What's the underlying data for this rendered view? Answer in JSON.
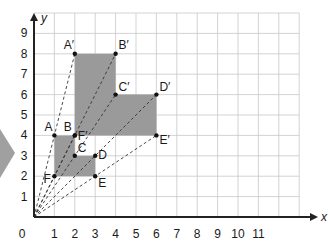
{
  "diagram": {
    "x_axis": {
      "label": "x",
      "ticks": [
        "0",
        "1",
        "2",
        "3",
        "4",
        "5",
        "6",
        "7",
        "8",
        "9",
        "10",
        "11"
      ]
    },
    "y_axis": {
      "label": "y",
      "ticks": [
        "1",
        "2",
        "3",
        "4",
        "5",
        "6",
        "7",
        "8",
        "9"
      ]
    },
    "grid": {
      "x_max": 13,
      "y_max": 10
    },
    "centre_of_enlargement": [
      0,
      0
    ],
    "original_shape": {
      "fill": "#9a9a9a",
      "points": [
        {
          "label": "A",
          "x": 1,
          "y": 4
        },
        {
          "label": "B",
          "x": 2,
          "y": 4
        },
        {
          "label": "C",
          "x": 2,
          "y": 3
        },
        {
          "label": "D",
          "x": 3,
          "y": 3
        },
        {
          "label": "E",
          "x": 3,
          "y": 2
        },
        {
          "label": "F",
          "x": 1,
          "y": 2
        }
      ]
    },
    "image_shape": {
      "fill": "#9a9a9a",
      "points": [
        {
          "label": "A′",
          "x": 2,
          "y": 8
        },
        {
          "label": "B′",
          "x": 4,
          "y": 8
        },
        {
          "label": "C′",
          "x": 4,
          "y": 6
        },
        {
          "label": "D′",
          "x": 6,
          "y": 6
        },
        {
          "label": "E′",
          "x": 6,
          "y": 4
        },
        {
          "label": "F′",
          "x": 2,
          "y": 4
        }
      ]
    },
    "pointer_arrow_color": "#a0a0a0",
    "grid_color": "#c8c8c8",
    "axis_color": "#222222"
  }
}
